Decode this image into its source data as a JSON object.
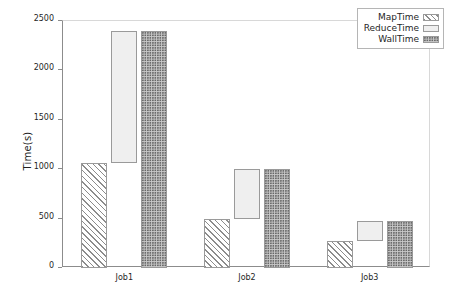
{
  "chart_data": {
    "type": "bar",
    "title": "",
    "xlabel": "",
    "ylabel": "Time(s)",
    "categories": [
      "Job1",
      "Job2",
      "Job3"
    ],
    "ylim": [
      0,
      2500
    ],
    "yticks": [
      0,
      500,
      1000,
      1500,
      2000,
      2500
    ],
    "ytick_labels": [
      "0",
      "500",
      "1000",
      "1500",
      "2000",
      "2500"
    ],
    "grid": false,
    "legend_position": "upper right",
    "bar_style": "grouped-with-floating-reduce",
    "series": [
      {
        "name": "MapTime",
        "pattern": "diagonal-hatch",
        "values": [
          1060,
          500,
          270
        ],
        "base": [
          0,
          0,
          0
        ]
      },
      {
        "name": "ReduceTime",
        "pattern": "light-dot",
        "values": [
          2400,
          1000,
          480
        ],
        "base": [
          1060,
          500,
          270
        ]
      },
      {
        "name": "WallTime",
        "pattern": "dark-dot",
        "values": [
          2400,
          1000,
          480
        ],
        "base": [
          0,
          0,
          0
        ]
      }
    ]
  },
  "legend": {
    "items": [
      {
        "label": "MapTime",
        "swatch": "diagonal-hatch-swatch"
      },
      {
        "label": "ReduceTime",
        "swatch": "light-dot-swatch"
      },
      {
        "label": "WallTime",
        "swatch": "dark-dot-swatch"
      }
    ]
  },
  "axes": {
    "y_label": "Time(s)"
  }
}
